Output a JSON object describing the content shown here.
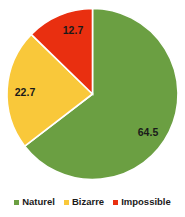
{
  "chart_data": {
    "type": "pie",
    "title": "",
    "subtitle": "",
    "xlabel": "",
    "ylabel": "",
    "categories": [
      "Naturel",
      "Bizarre",
      "Impossible"
    ],
    "values": [
      64.5,
      22.7,
      12.7
    ],
    "value_labels": [
      "64.5",
      "22.7",
      "12.7"
    ],
    "colors": [
      "#6b9f42",
      "#f9c83a",
      "#e92f10"
    ],
    "start_angle_deg": 0,
    "direction": "clockwise",
    "grid": false,
    "legend_position": "bottom",
    "slices": [
      {
        "name": "Naturel",
        "value": 64.5,
        "label": "64.5",
        "color": "#6b9f42",
        "label_x": 148,
        "label_y": 136
      },
      {
        "name": "Bizarre",
        "value": 22.7,
        "label": "22.7",
        "color": "#f9c83a",
        "label_x": 25,
        "label_y": 96
      },
      {
        "name": "Impossible",
        "value": 12.7,
        "label": "12.7",
        "color": "#e92f10",
        "label_x": 73,
        "label_y": 34
      }
    ]
  },
  "legend": {
    "items": [
      {
        "label": "Naturel",
        "color": "#6b9f42"
      },
      {
        "label": "Bizarre",
        "color": "#f9c83a"
      },
      {
        "label": "Impossible",
        "color": "#e92f10"
      }
    ]
  }
}
